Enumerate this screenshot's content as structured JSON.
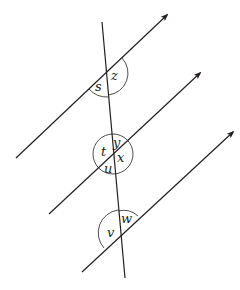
{
  "diagram": {
    "type": "parallel lines cut by a transversal",
    "parallel_lines": [
      {
        "id": "line-1",
        "from": [
          16,
          158
        ],
        "to": [
          167,
          15
        ],
        "arrow": true
      },
      {
        "id": "line-2",
        "from": [
          49,
          214
        ],
        "to": [
          200,
          73
        ],
        "arrow": true
      },
      {
        "id": "line-3",
        "from": [
          82,
          272
        ],
        "to": [
          233,
          132
        ],
        "arrow": true
      }
    ],
    "transversal": {
      "from": [
        102,
        22
      ],
      "to": [
        125,
        278
      ]
    },
    "angle_labels": {
      "s": "s",
      "z": "z",
      "t": "t",
      "y": "y",
      "x": "x",
      "u": "u",
      "v": "v",
      "w": "w"
    },
    "colors": {
      "stroke": "#231f20",
      "background": "#ffffff"
    }
  }
}
